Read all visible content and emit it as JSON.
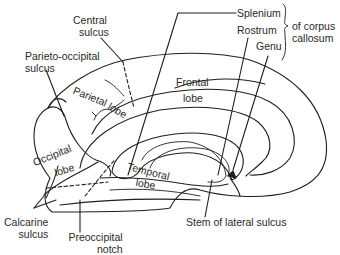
{
  "figure": {
    "line_color": "#1e1e1e",
    "background": "#ffffff"
  },
  "labels": {
    "central_sulcus": [
      "Central",
      "sulcus"
    ],
    "parieto_occipital_sulcus": [
      "Parieto-occipital",
      "sulcus"
    ],
    "splenium": "Splenium",
    "rostrum": "Rostrum",
    "genu": "Genu",
    "corpus_callosum_group": [
      "of corpus",
      "callosum"
    ],
    "parietal_lobe": [
      "Parietal",
      "lobe"
    ],
    "frontal_lobe": [
      "Frontal",
      "lobe"
    ],
    "occipital_lobe": [
      "Occipital",
      "lobe"
    ],
    "temporal_lobe": [
      "Temporal",
      "lobe"
    ],
    "calcarine_sulcus": [
      "Calcarine",
      "sulcus"
    ],
    "preoccipital_notch": [
      "Preoccipital",
      "notch"
    ],
    "stem_of_lateral_sulcus": "Stem of lateral sulcus"
  }
}
